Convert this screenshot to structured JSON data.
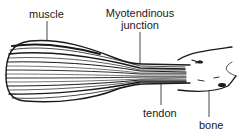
{
  "diagram": {
    "type": "anatomical-illustration",
    "colors": {
      "ink": "#1a1a1a",
      "background": "#ffffff"
    },
    "labels": [
      {
        "id": "muscle",
        "text": "muscle"
      },
      {
        "id": "myotendinous_junction",
        "line1": "Myotendinous",
        "line2": "junction"
      },
      {
        "id": "tendon",
        "text": "tendon"
      },
      {
        "id": "bone",
        "text": "bone"
      }
    ]
  }
}
